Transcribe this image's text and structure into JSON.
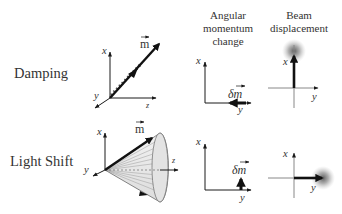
{
  "columns": {
    "angular_momentum": {
      "line1": "Angular",
      "line2": "momentum",
      "line3": "change"
    },
    "beam_displacement": {
      "line1": "Beam",
      "line2": "displacement"
    }
  },
  "rows": [
    {
      "label": "Damping",
      "vector_label": "m",
      "axes": {
        "x": "x",
        "y": "y",
        "z": "z"
      },
      "delta_label": "δm",
      "delta_direction": "-y (left)",
      "delta_axes": {
        "x": "x",
        "y": "y"
      },
      "beam_axes": {
        "x": "x",
        "y": "y"
      },
      "beam_displacement_direction": "+x (up)"
    },
    {
      "label": "Light Shift",
      "vector_label": "m",
      "axes": {
        "x": "x",
        "y": "y",
        "z": "z"
      },
      "delta_label": "δm",
      "delta_direction": "+x (up)",
      "delta_axes": {
        "x": "x",
        "y": "y"
      },
      "beam_axes": {
        "x": "x",
        "y": "y"
      },
      "beam_displacement_direction": "+y (right)"
    }
  ],
  "colors": {
    "ink": "#1a1a1a",
    "text": "#333333",
    "cone_fill": "#e6e6e6",
    "cone_lines": "#9a9a9a",
    "blob": "#6a6a6a"
  }
}
